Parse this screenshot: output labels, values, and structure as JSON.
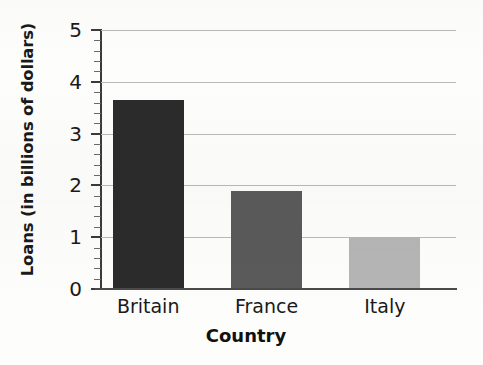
{
  "chart_data": {
    "type": "bar",
    "title": "",
    "categories": [
      "Britain",
      "France",
      "Italy"
    ],
    "values": [
      3.65,
      1.9,
      1.0
    ],
    "series": [
      {
        "name": "Loans",
        "values": [
          3.65,
          1.9,
          1.0
        ]
      }
    ],
    "bar_colors": [
      "#2b2b2b",
      "#5a5a5a",
      "#b5b5b5"
    ],
    "xlabel": "Country",
    "ylabel": "Loans (in billions of dollars)",
    "ylim": [
      0,
      5
    ],
    "xlim_categories": 3,
    "ytick_labels": [
      "5",
      "4",
      "3",
      "2",
      "1",
      "0"
    ],
    "ytick_values": [
      5,
      4,
      3,
      2,
      1,
      0
    ],
    "minor_tick_step": 0.2,
    "grid": true,
    "grid_axis": "y",
    "legend": false,
    "legend_position": "none"
  },
  "axes": {
    "y_title": "Loans (in billions of dollars)",
    "x_title": "Country"
  },
  "colors": {
    "background": "#fdfdfc",
    "grid": "#b9b9b9",
    "axis": "#3a3a3a",
    "text": "#1a1a1a",
    "bar_britain": "#2b2b2b",
    "bar_france": "#5a5a5a",
    "bar_italy": "#b5b5b5"
  }
}
